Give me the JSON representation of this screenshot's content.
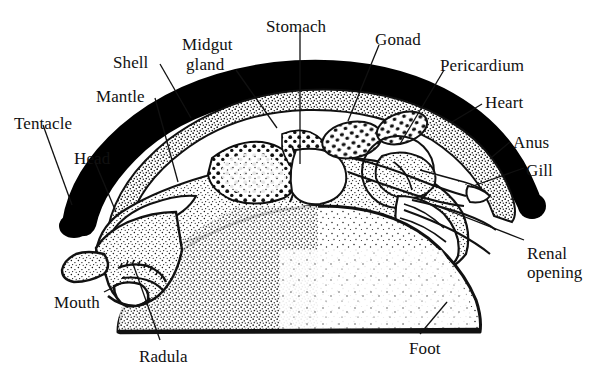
{
  "figure": {
    "style": "black-and-white stippled line drawing",
    "background_color": "#ffffff",
    "ink_color": "#111111",
    "shell_color": "#000000",
    "tissue_fill": "stipple"
  },
  "labels": [
    {
      "id": "tentacle",
      "text": "Tentacle",
      "x": 14,
      "y": 115,
      "align": "left"
    },
    {
      "id": "head",
      "text": "Head",
      "x": 74,
      "y": 150,
      "align": "left"
    },
    {
      "id": "mantle",
      "text": "Mantle",
      "x": 96,
      "y": 88,
      "align": "left"
    },
    {
      "id": "shell",
      "text": "Shell",
      "x": 113,
      "y": 54,
      "align": "left"
    },
    {
      "id": "midgut-gland",
      "text": "Midgut",
      "x": 182,
      "y": 36,
      "align": "left"
    },
    {
      "id": "midgut-gland2",
      "text": "gland",
      "x": 186,
      "y": 56,
      "align": "left"
    },
    {
      "id": "stomach",
      "text": "Stomach",
      "x": 266,
      "y": 18,
      "align": "left"
    },
    {
      "id": "gonad",
      "text": "Gonad",
      "x": 375,
      "y": 31,
      "align": "left"
    },
    {
      "id": "pericardium",
      "text": "Pericardium",
      "x": 440,
      "y": 57,
      "align": "left"
    },
    {
      "id": "heart",
      "text": "Heart",
      "x": 485,
      "y": 94,
      "align": "left"
    },
    {
      "id": "anus",
      "text": "Anus",
      "x": 513,
      "y": 134,
      "align": "left"
    },
    {
      "id": "gill",
      "text": "Gill",
      "x": 526,
      "y": 162,
      "align": "left"
    },
    {
      "id": "renal-opening",
      "text": "Renal",
      "x": 527,
      "y": 245,
      "align": "left"
    },
    {
      "id": "renal-opening2",
      "text": "opening",
      "x": 527,
      "y": 264,
      "align": "left"
    },
    {
      "id": "mouth",
      "text": "Mouth",
      "x": 54,
      "y": 294,
      "align": "left"
    },
    {
      "id": "radula",
      "text": "Radula",
      "x": 139,
      "y": 348,
      "align": "left"
    },
    {
      "id": "foot",
      "text": "Foot",
      "x": 409,
      "y": 340,
      "align": "left"
    }
  ],
  "leader_lines": [
    {
      "id": "tentacle-leader",
      "from": [
        43,
        125
      ],
      "to": [
        72,
        205
      ]
    },
    {
      "id": "head-leader",
      "from": [
        95,
        162
      ],
      "to": [
        116,
        212
      ]
    },
    {
      "id": "mantle-leader",
      "from": [
        155,
        98
      ],
      "to": [
        178,
        182
      ]
    },
    {
      "id": "shell-leader",
      "from": [
        160,
        64
      ],
      "to": [
        191,
        118
      ]
    },
    {
      "id": "midgut-leader",
      "from": [
        236,
        70
      ],
      "to": [
        277,
        128
      ]
    },
    {
      "id": "stomach-leader",
      "from": [
        300,
        30
      ],
      "to": [
        300,
        164
      ]
    },
    {
      "id": "gonad-leader",
      "from": [
        379,
        45
      ],
      "to": [
        348,
        121
      ]
    },
    {
      "id": "pericardium-leader",
      "from": [
        444,
        70
      ],
      "to": [
        400,
        144
      ]
    },
    {
      "id": "heart-leader",
      "from": [
        482,
        104
      ],
      "to": [
        452,
        122
      ]
    },
    {
      "id": "anus-leader",
      "from": [
        510,
        142
      ],
      "to": [
        492,
        157
      ]
    },
    {
      "id": "gill-leader",
      "from": [
        524,
        168
      ],
      "to": [
        473,
        186
      ]
    },
    {
      "id": "renal-leader",
      "from": [
        524,
        240
      ],
      "to": [
        437,
        206
      ]
    },
    {
      "id": "mouth-leader",
      "from": [
        104,
        292
      ],
      "to": [
        124,
        282
      ]
    },
    {
      "id": "radula-leader",
      "from": [
        160,
        340
      ],
      "to": [
        133,
        264
      ]
    },
    {
      "id": "foot-leader",
      "from": [
        420,
        334
      ],
      "to": [
        447,
        302
      ]
    }
  ],
  "anatomy_parts": [
    {
      "id": "shell",
      "name": "Shell",
      "render": "thick black arc over the body"
    },
    {
      "id": "mantle",
      "name": "Mantle",
      "render": "stippled layer beneath the shell"
    },
    {
      "id": "mantle-cavity",
      "name": "Mantle cavity",
      "render": "white space between mantle and body"
    },
    {
      "id": "midgut-gland",
      "name": "Midgut gland",
      "render": "coarse mottled mass, left of centre"
    },
    {
      "id": "stomach",
      "name": "Stomach",
      "render": "pale chamber at centre"
    },
    {
      "id": "gonad",
      "name": "Gonad",
      "render": "speckled oval right of centre"
    },
    {
      "id": "pericardium",
      "name": "Pericardium",
      "render": "circular outlined space around heart"
    },
    {
      "id": "heart",
      "name": "Heart",
      "render": "small chambered organ inside pericardium"
    },
    {
      "id": "anus",
      "name": "Anus",
      "render": "opening at posterior mantle cavity"
    },
    {
      "id": "gill",
      "name": "Gill",
      "render": "banded feathery structure, posterior right"
    },
    {
      "id": "renal-opening",
      "name": "Renal opening",
      "render": "pore below the gill"
    },
    {
      "id": "tentacle",
      "name": "Tentacle",
      "render": "tapered projection at anterior left"
    },
    {
      "id": "head",
      "name": "Head",
      "render": "anterior stippled region"
    },
    {
      "id": "mouth",
      "name": "Mouth",
      "render": "anterior ventral opening"
    },
    {
      "id": "radula",
      "name": "Radula",
      "render": "toothed ribbon inside the mouth"
    },
    {
      "id": "foot",
      "name": "Foot",
      "render": "large stippled ventral muscular mass"
    }
  ]
}
